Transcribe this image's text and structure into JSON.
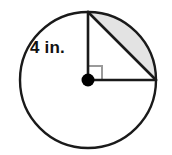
{
  "figure": {
    "kind": "geometry-diagram",
    "background_color": "#ffffff",
    "stroke_color": "#1a1a1a",
    "shade_color": "#e3e3e3",
    "right_angle_color": "#9a9a9a",
    "labels": {
      "radius": "4 in."
    },
    "circle": {
      "center_x": 88,
      "center_y": 80,
      "radius": 68,
      "stroke_width": 2.4
    },
    "center_dot": {
      "radius": 6.5,
      "fill": "#000000"
    },
    "radii": [
      {
        "name": "vertical-radius",
        "x1": 88,
        "y1": 80,
        "x2": 88,
        "y2": 12
      },
      {
        "name": "horizontal-radius",
        "x1": 88,
        "y1": 80,
        "x2": 156,
        "y2": 80
      }
    ],
    "chord": {
      "x1": 88,
      "y1": 12,
      "x2": 156,
      "y2": 80
    },
    "right_angle_marker": {
      "x": 88,
      "y": 66,
      "size": 14
    },
    "segment_path": "M 88 12 A 68 68 0 0 1 156 80 L 88 12 Z",
    "label_position": {
      "x": 30,
      "y": 53
    },
    "angle_degrees": 90
  }
}
